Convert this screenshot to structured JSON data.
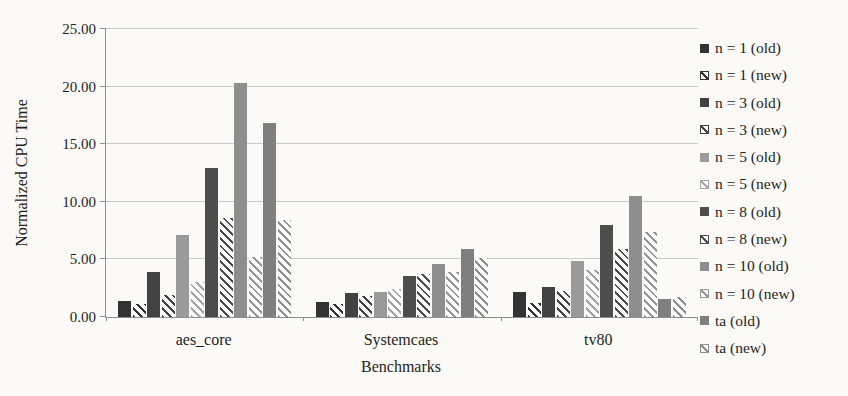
{
  "chart_data": {
    "type": "bar",
    "title": "",
    "xlabel": "Benchmarks",
    "ylabel": "Normalized CPU Time",
    "ylim": [
      0,
      25
    ],
    "ytick_labels": [
      "0.00",
      "5.00",
      "10.00",
      "15.00",
      "20.00",
      "25.00"
    ],
    "grid": true,
    "legend_position": "right",
    "categories": [
      "aes_core",
      "Systemcaes",
      "tv80"
    ],
    "series": [
      {
        "name": "n = 1 (old)",
        "pattern": "solid",
        "color": "#333333",
        "values": [
          1.4,
          1.3,
          2.2
        ]
      },
      {
        "name": "n = 1 (new)",
        "pattern": "hatch",
        "color": "#333333",
        "values": [
          1.1,
          1.1,
          1.2
        ]
      },
      {
        "name": "n = 3 (old)",
        "pattern": "solid",
        "color": "#424242",
        "values": [
          3.9,
          2.1,
          2.6
        ]
      },
      {
        "name": "n = 3 (new)",
        "pattern": "hatch",
        "color": "#424242",
        "values": [
          1.9,
          1.8,
          2.3
        ]
      },
      {
        "name": "n = 5 (old)",
        "pattern": "solid",
        "color": "#9a9a9a",
        "values": [
          7.1,
          2.2,
          4.9
        ]
      },
      {
        "name": "n = 5 (new)",
        "pattern": "hatch",
        "color": "#a3a3a3",
        "values": [
          3.0,
          2.4,
          4.1
        ]
      },
      {
        "name": "n = 8 (old)",
        "pattern": "solid",
        "color": "#4d4d4d",
        "values": [
          12.9,
          3.6,
          8.0
        ]
      },
      {
        "name": "n = 8 (new)",
        "pattern": "hatch",
        "color": "#4d4d4d",
        "values": [
          8.6,
          3.7,
          5.9
        ]
      },
      {
        "name": "n = 10 (old)",
        "pattern": "solid",
        "color": "#8e8e8e",
        "values": [
          20.3,
          4.6,
          10.5
        ]
      },
      {
        "name": "n = 10 (new)",
        "pattern": "hatch",
        "color": "#979797",
        "values": [
          5.2,
          3.9,
          7.4
        ]
      },
      {
        "name": "ta (old)",
        "pattern": "solid",
        "color": "#7f7f7f",
        "values": [
          16.8,
          5.9,
          1.6
        ]
      },
      {
        "name": "ta (new)",
        "pattern": "hatch",
        "color": "#8e8e8e",
        "values": [
          8.4,
          5.1,
          1.7
        ]
      }
    ]
  }
}
